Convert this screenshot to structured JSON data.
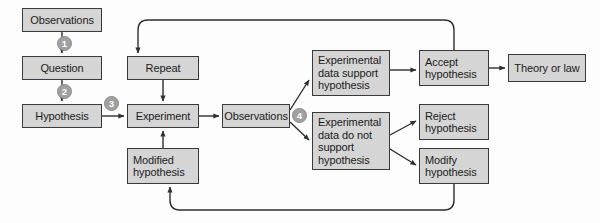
{
  "diagram": {
    "style": {
      "node_fill": "#d5d5d5",
      "node_border": "#3a3a3a",
      "badge_fill": "#a0a0a0",
      "badge_text": "#ffffff",
      "edge_color": "#2e2e2e",
      "background": "#fdfdfd"
    },
    "nodes": [
      {
        "id": "observations_start",
        "label": "Observations",
        "x": 22,
        "y": 8,
        "w": 80,
        "h": 24
      },
      {
        "id": "question",
        "label": "Question",
        "x": 22,
        "y": 56,
        "w": 80,
        "h": 24
      },
      {
        "id": "hypothesis",
        "label": "Hypothesis",
        "x": 22,
        "y": 104,
        "w": 80,
        "h": 24
      },
      {
        "id": "repeat",
        "label": "Repeat",
        "x": 127,
        "y": 56,
        "w": 72,
        "h": 24
      },
      {
        "id": "experiment",
        "label": "Experiment",
        "x": 127,
        "y": 104,
        "w": 72,
        "h": 24
      },
      {
        "id": "modified_hypothesis",
        "label": "Modified\nhypothesis",
        "x": 127,
        "y": 148,
        "w": 72,
        "h": 36
      },
      {
        "id": "observations_mid",
        "label": "Observations",
        "x": 222,
        "y": 104,
        "w": 68,
        "h": 24
      },
      {
        "id": "data_support",
        "label": "Experimental\ndata support\nhypothesis",
        "x": 312,
        "y": 50,
        "w": 78,
        "h": 46
      },
      {
        "id": "data_do_not_support",
        "label": "Experimental\ndata do not\nsupport\nhypothesis",
        "x": 312,
        "y": 112,
        "w": 78,
        "h": 58
      },
      {
        "id": "accept_hypothesis",
        "label": "Accept\nhypothesis",
        "x": 419,
        "y": 50,
        "w": 70,
        "h": 36
      },
      {
        "id": "reject_hypothesis",
        "label": "Reject\nhypothesis",
        "x": 419,
        "y": 104,
        "w": 70,
        "h": 36
      },
      {
        "id": "modify_hypothesis",
        "label": "Modify\nhypothesis",
        "x": 419,
        "y": 148,
        "w": 70,
        "h": 36
      },
      {
        "id": "theory_or_law",
        "label": "Theory or law",
        "x": 508,
        "y": 54,
        "w": 78,
        "h": 28
      }
    ],
    "step_badges": [
      {
        "id": "step-1",
        "number": "1",
        "x": 57,
        "y": 36
      },
      {
        "id": "step-2",
        "number": "2",
        "x": 57,
        "y": 84
      },
      {
        "id": "step-3",
        "number": "3",
        "x": 104,
        "y": 96
      },
      {
        "id": "step-4",
        "number": "4",
        "x": 292,
        "y": 108
      }
    ],
    "edges": [
      {
        "id": "observations-to-question",
        "from": "observations_start",
        "to": "question"
      },
      {
        "id": "question-to-hypothesis",
        "from": "question",
        "to": "hypothesis"
      },
      {
        "id": "hypothesis-to-experiment",
        "from": "hypothesis",
        "to": "experiment"
      },
      {
        "id": "repeat-to-experiment",
        "from": "repeat",
        "to": "experiment"
      },
      {
        "id": "modified-hypothesis-to-experiment",
        "from": "modified_hypothesis",
        "to": "experiment"
      },
      {
        "id": "experiment-to-observations",
        "from": "experiment",
        "to": "observations_mid"
      },
      {
        "id": "observations-to-data-support",
        "from": "observations_mid",
        "to": "data_support"
      },
      {
        "id": "observations-to-data-do-not-support",
        "from": "observations_mid",
        "to": "data_do_not_support"
      },
      {
        "id": "data-support-to-accept",
        "from": "data_support",
        "to": "accept_hypothesis"
      },
      {
        "id": "data-do-not-support-to-reject",
        "from": "data_do_not_support",
        "to": "reject_hypothesis"
      },
      {
        "id": "data-do-not-support-to-modify",
        "from": "data_do_not_support",
        "to": "modify_hypothesis"
      },
      {
        "id": "accept-to-theory",
        "from": "accept_hypothesis",
        "to": "theory_or_law"
      },
      {
        "id": "accept-to-repeat-loop",
        "from": "accept_hypothesis",
        "to": "repeat"
      },
      {
        "id": "modify-to-modified-hypothesis-loop",
        "from": "modify_hypothesis",
        "to": "modified_hypothesis"
      }
    ]
  }
}
